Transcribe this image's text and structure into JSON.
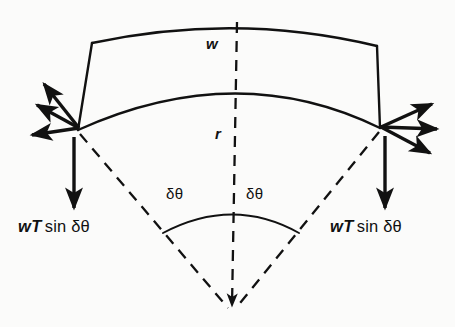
{
  "figure": {
    "background_color": "#fbfbfa",
    "ink_color": "#111111"
  },
  "labels": {
    "width": "w",
    "radius": "r",
    "angle_left": "δθ",
    "angle_right": "δθ",
    "force_left": {
      "magnitude": "wT",
      "function": "sin",
      "argument": "δθ"
    },
    "force_right": {
      "magnitude": "wT",
      "function": "sin",
      "argument": "δθ"
    }
  },
  "geometry": {
    "apex": {
      "x": 232,
      "y": 310
    },
    "outer_radius": 292,
    "inner_radius": 245,
    "half_angle_deg": 28,
    "outer_arc": {
      "left_x": 92,
      "left_y": 43,
      "mid_x": 237,
      "mid_y": 23,
      "right_x": 377,
      "right_y": 46
    },
    "inner_arc": {
      "left_x": 78,
      "left_y": 130,
      "mid_x": 237,
      "mid_y": 70,
      "right_x": 380,
      "right_y": 128
    },
    "angle_arc_radius": 108
  },
  "arrows": {
    "left_tension": {
      "count": 3,
      "direction": "up-left",
      "meaning": "tension-pull-left"
    },
    "right_tension": {
      "count": 3,
      "direction": "down-right",
      "meaning": "tension-pull-right"
    },
    "left_resultant": {
      "count": 1,
      "direction": "down",
      "meaning": "wT-sin-delta-theta-left"
    },
    "right_resultant": {
      "count": 1,
      "direction": "down",
      "meaning": "wT-sin-delta-theta-right"
    },
    "center_radius": {
      "count": 1,
      "direction": "down",
      "meaning": "radius-line-to-centre"
    }
  }
}
